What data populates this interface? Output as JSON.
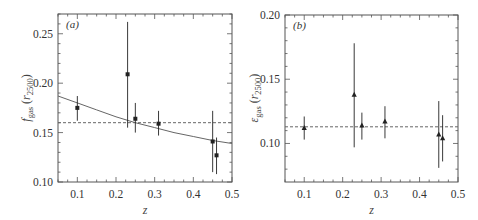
{
  "chart_data": [
    {
      "type": "scatter",
      "panel_label": "(a)",
      "xlabel": "z",
      "ylabel": "f_gas (r_2500)",
      "ylabel_main": "f",
      "ylabel_sub": "gas",
      "ylabel_paren_var": "r",
      "ylabel_paren_sub": "2500",
      "xlim": [
        0.05,
        0.5
      ],
      "ylim": [
        0.1,
        0.27
      ],
      "xticks": [
        0.1,
        0.2,
        0.3,
        0.4,
        0.5
      ],
      "xtick_labels": [
        "0.1",
        "0.2",
        "0.3",
        "0.4",
        "0.5"
      ],
      "yticks": [
        0.1,
        0.15,
        0.2,
        0.25
      ],
      "ytick_labels": [
        "0.10",
        "0.15",
        "0.20",
        "0.25"
      ],
      "marker": "square",
      "points": [
        {
          "x": 0.1,
          "y": 0.175,
          "ylow": 0.162,
          "yhigh": 0.187
        },
        {
          "x": 0.23,
          "y": 0.209,
          "ylow": 0.155,
          "yhigh": 0.262
        },
        {
          "x": 0.25,
          "y": 0.164,
          "ylow": 0.15,
          "yhigh": 0.18
        },
        {
          "x": 0.31,
          "y": 0.159,
          "ylow": 0.147,
          "yhigh": 0.172
        },
        {
          "x": 0.45,
          "y": 0.141,
          "ylow": 0.11,
          "yhigh": 0.172
        },
        {
          "x": 0.46,
          "y": 0.127,
          "ylow": 0.108,
          "yhigh": 0.145
        }
      ],
      "lines": [
        {
          "name": "fit curve",
          "style": "solid",
          "x": [
            0.05,
            0.1,
            0.15,
            0.2,
            0.25,
            0.3,
            0.35,
            0.4,
            0.45,
            0.5
          ],
          "y": [
            0.187,
            0.18,
            0.173,
            0.166,
            0.16,
            0.155,
            0.15,
            0.146,
            0.142,
            0.139
          ]
        },
        {
          "name": "constant",
          "style": "dashed",
          "x": [
            0.05,
            0.5
          ],
          "y": [
            0.16,
            0.16
          ]
        }
      ],
      "grid": false
    },
    {
      "type": "scatter",
      "panel_label": "(b)",
      "xlabel": "z",
      "ylabel": "ε_gas (r_2500)",
      "ylabel_main": "ε",
      "ylabel_sub": "gas",
      "ylabel_paren_var": "r",
      "ylabel_paren_sub": "2500",
      "xlim": [
        0.05,
        0.5
      ],
      "ylim": [
        0.07,
        0.2
      ],
      "xticks": [
        0.1,
        0.2,
        0.3,
        0.4,
        0.5
      ],
      "xtick_labels": [
        "0.1",
        "0.2",
        "0.3",
        "0.4",
        "0.5"
      ],
      "yticks": [
        0.1,
        0.15,
        0.2
      ],
      "ytick_labels": [
        "0.10",
        "0.15",
        "0.20"
      ],
      "marker": "triangle",
      "points": [
        {
          "x": 0.1,
          "y": 0.112,
          "ylow": 0.103,
          "yhigh": 0.121
        },
        {
          "x": 0.23,
          "y": 0.138,
          "ylow": 0.097,
          "yhigh": 0.178
        },
        {
          "x": 0.25,
          "y": 0.114,
          "ylow": 0.103,
          "yhigh": 0.124
        },
        {
          "x": 0.31,
          "y": 0.117,
          "ylow": 0.104,
          "yhigh": 0.129
        },
        {
          "x": 0.45,
          "y": 0.107,
          "ylow": 0.081,
          "yhigh": 0.133
        },
        {
          "x": 0.46,
          "y": 0.104,
          "ylow": 0.086,
          "yhigh": 0.122
        }
      ],
      "lines": [
        {
          "name": "constant",
          "style": "dashed",
          "x": [
            0.05,
            0.5
          ],
          "y": [
            0.113,
            0.113
          ]
        }
      ],
      "grid": false
    }
  ],
  "colors": {
    "axis": "#555555",
    "data": "#222222",
    "line": "#666666"
  }
}
